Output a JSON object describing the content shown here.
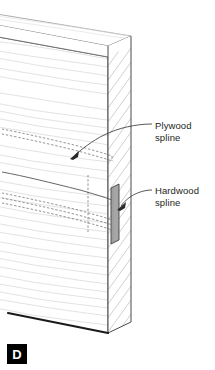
{
  "figure": {
    "marker_label": "D",
    "marker_bg_color": "#000000",
    "marker_text_color": "#ffffff",
    "background_color": "#ffffff"
  },
  "callouts": [
    {
      "id": "plywood-spline",
      "line1": "Plywood",
      "line2": "spline",
      "text_color": "#231f20",
      "leader_color": "#3b3b3b"
    },
    {
      "id": "hardwood-spline",
      "line1": "Hardwood",
      "line2": "spline",
      "text_color": "#231f20",
      "leader_color": "#3b3b3b"
    }
  ],
  "drawing": {
    "title": "Panel edge with plywood and hardwood splines",
    "board_outline_color": "#4a4a4a",
    "board_fill_color": "#ffffff",
    "edge_hatch_color": "#9b9b9b",
    "wood_grain_color": "#d3d3d3",
    "hidden_line_color": "#6f6f6f",
    "hardwood_spline_fill": "#a6a6a6",
    "hardwood_spline_stroke": "#4a4a4a",
    "bottom_edge_color": "#1a1a1a"
  }
}
